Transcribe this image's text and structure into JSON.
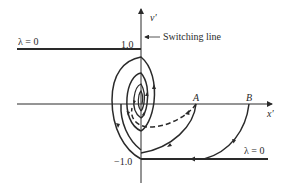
{
  "figure": {
    "type": "phase-plane-diagram",
    "axes": {
      "x_label": "x′",
      "y_label": "v′",
      "y_tick_top": "1.0",
      "y_tick_bottom": "−1.0"
    },
    "annotations": {
      "switching_line": "Switching line",
      "lambda_upper": "λ = 0",
      "lambda_lower": "λ = 0",
      "point_a": "A",
      "point_b": "B"
    },
    "colors": {
      "stroke": "#2a2a2a",
      "background": "#ffffff"
    }
  }
}
